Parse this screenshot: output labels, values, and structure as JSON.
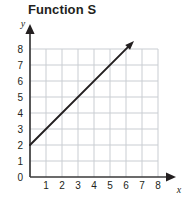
{
  "chart_data": {
    "type": "line",
    "title": "Function S",
    "xlabel": "x",
    "ylabel": "y",
    "xlim": [
      0,
      8
    ],
    "ylim": [
      0,
      8
    ],
    "grid": true,
    "legend": "none",
    "x_ticks": [
      "1",
      "2",
      "3",
      "4",
      "5",
      "6",
      "7",
      "8"
    ],
    "x_tick_values": [
      1,
      2,
      3,
      4,
      5,
      6,
      7,
      8
    ],
    "y_ticks": [
      "0",
      "1",
      "2",
      "3",
      "4",
      "5",
      "6",
      "7",
      "8"
    ],
    "y_tick_values": [
      0,
      1,
      2,
      3,
      4,
      5,
      6,
      7,
      8
    ],
    "series": [
      {
        "name": "Function S",
        "kind": "ray",
        "slope": 1,
        "intercept": 2,
        "equation": "y = x + 2",
        "arrow_end": true,
        "x": [
          0,
          6.5
        ],
        "values": [
          2,
          8.5
        ],
        "points": [
          [
            0,
            2
          ],
          [
            1,
            3
          ],
          [
            2,
            4
          ],
          [
            3,
            5
          ],
          [
            4,
            6
          ],
          [
            5,
            7
          ],
          [
            6,
            8
          ]
        ],
        "color": "#231f20"
      }
    ],
    "colors": {
      "line": "#231f20",
      "axis": "#3a3a3a",
      "grid": "#c9cdd2",
      "text": "#231f20",
      "background": "#ffffff"
    }
  }
}
